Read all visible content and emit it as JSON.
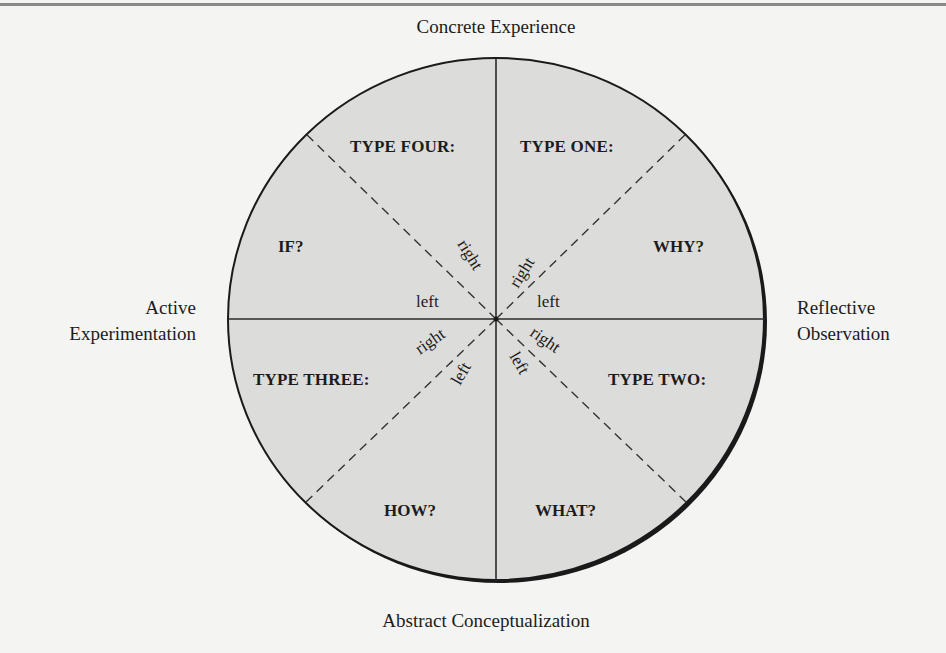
{
  "diagram": {
    "axes": {
      "top": "Concrete Experience",
      "bottom": "Abstract Conceptualization",
      "left_line1": "Active",
      "left_line2": "Experimentation",
      "right_line1": "Reflective",
      "right_line2": "Observation"
    },
    "quadrants": {
      "upper_left": {
        "type": "TYPE FOUR:",
        "question": "IF?"
      },
      "upper_right": {
        "type": "TYPE ONE:",
        "question": "WHY?"
      },
      "lower_right": {
        "type": "TYPE TWO:",
        "question": "WHAT?"
      },
      "lower_left": {
        "type": "TYPE THREE:",
        "question": "HOW?"
      }
    },
    "hemisphere_labels": {
      "ul_right": "right",
      "ul_left": "left",
      "ur_right": "right",
      "ur_left": "left",
      "lr_right": "right",
      "lr_left": "left",
      "ll_right": "right",
      "ll_left": "left"
    },
    "colors": {
      "circle_fill": "#dcdcdb",
      "stroke": "#1a1a1a",
      "page_bg": "#f4f4f3"
    }
  }
}
